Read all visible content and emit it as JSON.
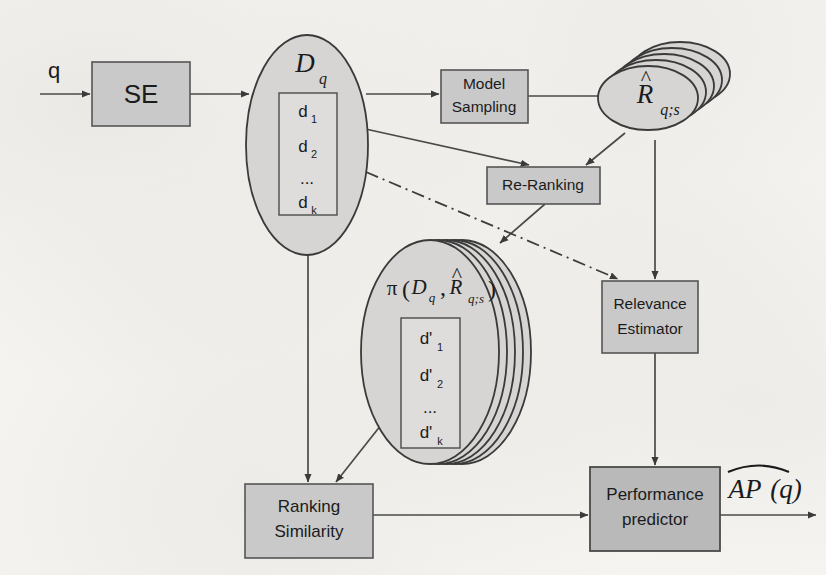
{
  "figure": {
    "type": "flow-diagram",
    "domain": "information-retrieval",
    "background_color": "#f7f6f3",
    "node_fill_color": "#c9c9c9",
    "node_stroke_color": "#555555",
    "shape_fill_color": "#d6d5d3",
    "line_color": "#4a4a4a"
  },
  "nodes": {
    "query_input": {
      "label": "q",
      "shape": "text-label"
    },
    "se": {
      "label": "SE",
      "shape": "rect"
    },
    "dq": {
      "label": "D",
      "subscript": "q",
      "shape": "ellipse",
      "items": [
        "d",
        "d",
        "...",
        "d"
      ],
      "item_subs": [
        "1",
        "2",
        "",
        "k"
      ]
    },
    "model_sampling": {
      "line1": "Model",
      "line2": "Sampling",
      "shape": "rect"
    },
    "rqs": {
      "label": "R",
      "hat": "^",
      "subscript": "q;s",
      "shape": "stacked-ellipse",
      "stack_count": 5
    },
    "re_ranking": {
      "label": "Re-Ranking",
      "shape": "rect"
    },
    "pi_stack": {
      "prefix": "π",
      "open_paren": "(",
      "arg1": "D",
      "arg1_sub": "q",
      "comma": ",",
      "arg2": "R",
      "arg2_hat": "^",
      "arg2_sub": "q;s",
      "close_paren": ")",
      "shape": "stacked-ellipse",
      "stack_count": 5,
      "items": [
        "d'",
        "d'",
        "...",
        "d'"
      ],
      "item_subs": [
        "1",
        "2",
        "",
        "k"
      ]
    },
    "relevance_estimator": {
      "line1": "Relevance",
      "line2": "Estimator",
      "shape": "rect"
    },
    "ranking_similarity": {
      "line1": "Ranking",
      "line2": "Similarity",
      "shape": "rect"
    },
    "performance_predictor": {
      "line1": "Performance",
      "line2": "predictor",
      "shape": "rect"
    },
    "output": {
      "label": "AP",
      "hat": "^",
      "suffix": "(q)",
      "shape": "text-label"
    }
  },
  "edges": [
    {
      "from": "query_input",
      "to": "se",
      "style": "solid"
    },
    {
      "from": "se",
      "to": "dq",
      "style": "solid"
    },
    {
      "from": "dq",
      "to": "model_sampling",
      "style": "solid"
    },
    {
      "from": "model_sampling",
      "to": "rqs",
      "style": "solid"
    },
    {
      "from": "dq",
      "to": "re_ranking",
      "style": "solid"
    },
    {
      "from": "rqs",
      "to": "re_ranking",
      "style": "solid"
    },
    {
      "from": "re_ranking",
      "to": "pi_stack",
      "style": "solid"
    },
    {
      "from": "dq",
      "to": "relevance_estimator",
      "style": "dash-dot"
    },
    {
      "from": "rqs",
      "to": "relevance_estimator",
      "style": "solid"
    },
    {
      "from": "dq",
      "to": "ranking_similarity",
      "style": "solid"
    },
    {
      "from": "pi_stack",
      "to": "ranking_similarity",
      "style": "solid"
    },
    {
      "from": "ranking_similarity",
      "to": "performance_predictor",
      "style": "solid"
    },
    {
      "from": "relevance_estimator",
      "to": "performance_predictor",
      "style": "solid"
    },
    {
      "from": "performance_predictor",
      "to": "output",
      "style": "solid"
    }
  ]
}
